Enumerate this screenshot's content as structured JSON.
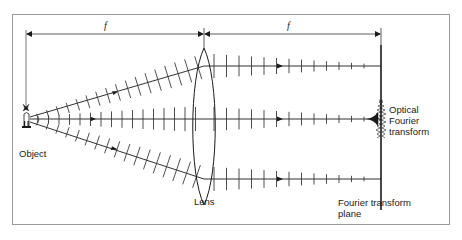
{
  "diagram": {
    "title": "",
    "dimension_labels": {
      "left_focal": "f",
      "right_focal": "f"
    },
    "labels": {
      "object": "Object",
      "lens": "Lens",
      "optical_ft_line1": "Optical",
      "optical_ft_line2": "Fourier",
      "optical_ft_line3": "transform",
      "ft_plane_line1": "Fourier transform",
      "ft_plane_line2": "plane"
    },
    "colors": {
      "frame": "#9a9a9a",
      "ink": "#1a1a1a",
      "wavefront": "#3a3a3a"
    }
  }
}
